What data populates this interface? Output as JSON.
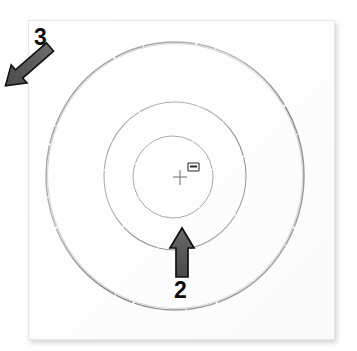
{
  "figure": {
    "background_color": "#ffffff",
    "paper_color": "#ffffff",
    "line_color": "#9a9a9a",
    "arrow_fill_color": "#555555",
    "arrow_stroke_color": "#111111",
    "label_color": "#0d0d0d"
  },
  "callouts": [
    {
      "id": "callout-3",
      "number": "3",
      "points_to": "outer-circle",
      "arrow_direction": "down-right",
      "label_x": 34,
      "label_y": 26
    },
    {
      "id": "callout-2",
      "number": "2",
      "points_to": "middle-circle",
      "arrow_direction": "up",
      "label_x": 174,
      "label_y": 279
    }
  ],
  "geometry": {
    "outer_circle": {
      "cx": 175,
      "cy": 176,
      "rx": 129,
      "ry": 134
    },
    "middle_circle": {
      "cx": 175,
      "cy": 176,
      "rx": 71,
      "ry": 74
    },
    "inner_circle": {
      "cx": 173,
      "cy": 177,
      "rx": 40,
      "ry": 41
    },
    "center_crosshair": {
      "cx": 180,
      "cy": 177,
      "size": 14
    },
    "center_tag": {
      "x": 188,
      "y": 163,
      "w": 11,
      "h": 8
    }
  },
  "arrows": {
    "callout_3_arrow": {
      "tail_x": 50,
      "tail_y": 47,
      "head_x": 86,
      "head_y": 90,
      "shaft_width": 11,
      "head_width": 24,
      "head_length": 20
    },
    "callout_2_arrow": {
      "tail_x": 182,
      "tail_y": 277,
      "head_x": 182,
      "head_y": 228,
      "shaft_width": 12,
      "head_width": 24,
      "head_length": 20
    }
  }
}
